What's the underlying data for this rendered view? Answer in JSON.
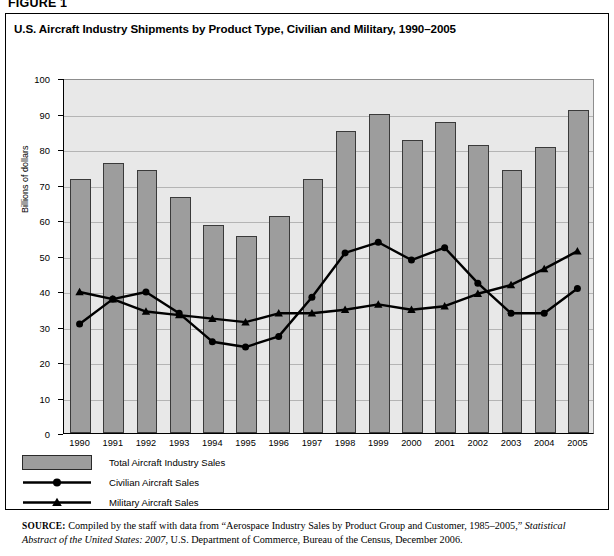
{
  "figure": {
    "label": "FIGURE 1",
    "title": "U.S. Aircraft Industry Shipments by Product Type, Civilian and Military, 1990–2005"
  },
  "legend": [
    {
      "key": "total",
      "label": "Total Aircraft Industry Sales",
      "marker": "bar-swatch",
      "color": "#9d9d9d"
    },
    {
      "key": "civilian",
      "label": "Civilian Aircraft Sales",
      "marker": "line-circle",
      "color": "#000000"
    },
    {
      "key": "military",
      "label": "Military Aircraft Sales",
      "marker": "line-triangle",
      "color": "#000000"
    }
  ],
  "source": {
    "prefix": "SOURCE:",
    "part1": " Compiled by the staff with data from “Aerospace Industry Sales by Product Group and Customer, 1985–2005,” ",
    "italic1": "Statistical Abstract of the United States: 2007",
    "part2": ", U.S. Department of Commerce, Bureau of the Census, December 2006."
  },
  "chart_data": {
    "type": "bar",
    "title": "U.S. Aircraft Industry Shipments by Product Type, Civilian and Military, 1990–2005",
    "xlabel": "",
    "ylabel": "Billions of dollars",
    "ylim": [
      0,
      100
    ],
    "ytick_step": 10,
    "yticks": [
      0,
      10,
      20,
      30,
      40,
      50,
      60,
      70,
      80,
      90,
      100
    ],
    "grid": true,
    "legend_position": "below-plot-left",
    "categories": [
      "1990",
      "1991",
      "1992",
      "1993",
      "1994",
      "1995",
      "1996",
      "1997",
      "1998",
      "1999",
      "2000",
      "2001",
      "2002",
      "2003",
      "2004",
      "2005"
    ],
    "series": [
      {
        "name": "Total Aircraft Industry Sales",
        "type": "bar",
        "color": "#9d9d9d",
        "values": [
          71.5,
          76.0,
          74.0,
          66.5,
          58.5,
          55.5,
          61.0,
          71.5,
          85.0,
          90.0,
          82.5,
          87.5,
          81.0,
          74.0,
          80.5,
          91.0
        ]
      },
      {
        "name": "Civilian Aircraft Sales",
        "type": "line",
        "marker": "circle",
        "color": "#000000",
        "values": [
          31.0,
          38.0,
          40.0,
          34.0,
          26.0,
          24.5,
          27.5,
          38.5,
          51.0,
          54.0,
          49.0,
          52.5,
          42.5,
          34.0,
          34.0,
          41.0
        ]
      },
      {
        "name": "Military Aircraft Sales",
        "type": "line",
        "marker": "triangle",
        "color": "#000000",
        "values": [
          40.0,
          38.0,
          34.5,
          33.5,
          32.5,
          31.5,
          34.0,
          34.0,
          35.0,
          36.5,
          35.0,
          36.0,
          39.5,
          42.0,
          46.5,
          51.5
        ]
      }
    ]
  }
}
